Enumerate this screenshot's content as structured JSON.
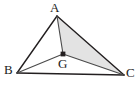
{
  "figure": {
    "type": "geometry-diagram",
    "background_color": "#ffffff",
    "stroke_color": "#231f20",
    "shaded_fill_color": "#e3e3e3",
    "point_marker_color": "#231f20",
    "canvas": {
      "width": 138,
      "height": 88
    },
    "points": {
      "A": {
        "label": "A",
        "x": 57,
        "y": 16,
        "label_x": 50,
        "label_y": 1,
        "marker": false
      },
      "B": {
        "label": "B",
        "x": 17,
        "y": 73,
        "label_x": 4,
        "label_y": 63,
        "marker": false
      },
      "C": {
        "label": "C",
        "x": 124,
        "y": 75,
        "label_x": 126,
        "label_y": 66,
        "marker": false
      },
      "G": {
        "label": "G",
        "x": 63,
        "y": 54,
        "label_x": 58,
        "label_y": 57,
        "marker": true
      }
    },
    "segments": [
      {
        "name": "side-AB",
        "from": "A",
        "to": "B"
      },
      {
        "name": "side-BC",
        "from": "B",
        "to": "C"
      },
      {
        "name": "side-CA",
        "from": "C",
        "to": "A"
      },
      {
        "name": "cevian-AG",
        "from": "A",
        "to": "G"
      },
      {
        "name": "cevian-BG",
        "from": "B",
        "to": "G"
      },
      {
        "name": "cevian-GC",
        "from": "G",
        "to": "C"
      }
    ],
    "shaded_region": {
      "name": "triangle-AGC",
      "vertices": [
        "A",
        "G",
        "C"
      ]
    }
  }
}
